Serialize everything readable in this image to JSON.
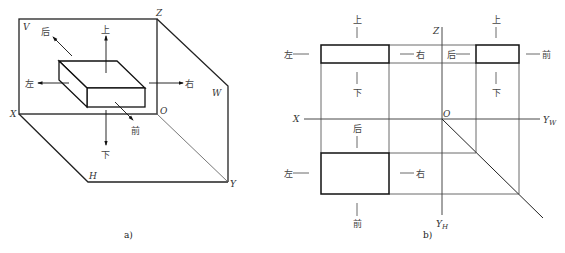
{
  "figure_a": {
    "caption": "a)",
    "axis_labels": {
      "V": "V",
      "Z": "Z",
      "W": "W",
      "X": "X",
      "O": "O",
      "H": "H",
      "Y": "Y"
    },
    "directions": {
      "up": "上",
      "down": "下",
      "left": "左",
      "right": "右",
      "back": "后",
      "front": "前"
    }
  },
  "figure_b": {
    "caption": "b)",
    "axis_labels": {
      "Z": "Z",
      "X": "X",
      "O": "O",
      "YW": "Y",
      "YW_sub": "W",
      "YH": "Y",
      "YH_sub": "H"
    },
    "front_view": {
      "up": "上",
      "down": "下",
      "left": "左",
      "right": "右"
    },
    "side_view": {
      "up": "上",
      "down": "下",
      "back": "后",
      "front": "前"
    },
    "top_view": {
      "back": "后",
      "front": "前",
      "left": "左",
      "right": "右"
    }
  }
}
